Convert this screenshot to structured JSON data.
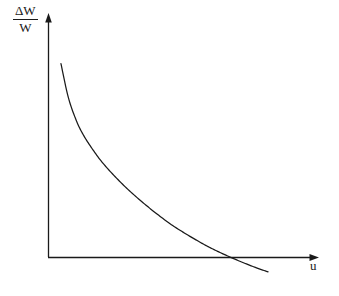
{
  "figure": {
    "background_color": "#ffffff",
    "ink_color": "#1a1a1a"
  },
  "axes": {
    "y_axis": {
      "label_numerator": "ΔW",
      "label_denominator": "W",
      "arrow": "arrow-up"
    },
    "x_axis": {
      "label": "u",
      "arrow": "arrow-right"
    }
  },
  "chart_data": {
    "type": "line",
    "title": "",
    "xlabel": "u",
    "ylabel": "ΔW/W",
    "grid": false,
    "legend": null,
    "axis_style": "arrow-axes",
    "tick_labels": {
      "x": [],
      "y": []
    },
    "xlim": [
      0,
      1
    ],
    "ylim": [
      -0.1,
      1
    ],
    "annotations": [
      "curve starts high on the left near the vertical axis",
      "curve decreases monotonically and convexly",
      "curve crosses the horizontal axis and continues below it"
    ],
    "series": [
      {
        "name": "ΔW/W",
        "color": "#1a1a1a",
        "x": [
          0.048,
          0.075,
          0.104,
          0.13,
          0.163,
          0.2,
          0.244,
          0.296,
          0.352,
          0.4,
          0.452,
          0.5,
          0.548,
          0.593,
          0.637,
          0.681,
          0.726,
          0.77,
          0.815
        ],
        "y": [
          0.843,
          0.7,
          0.602,
          0.54,
          0.48,
          0.422,
          0.365,
          0.305,
          0.248,
          0.203,
          0.158,
          0.122,
          0.089,
          0.06,
          0.035,
          0.012,
          -0.01,
          -0.03,
          -0.048
        ]
      }
    ]
  }
}
